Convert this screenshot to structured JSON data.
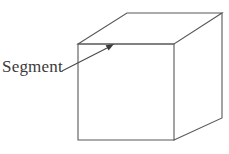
{
  "figure": {
    "background_color": "#ffffff",
    "line_color": "#585858",
    "text_color": "#3a3a3a",
    "label": {
      "text": "Segment",
      "x": 2,
      "y": 57,
      "font_size_px": 17
    },
    "leader_line": {
      "from": [
        62,
        71
      ],
      "to": [
        113,
        45
      ],
      "arrow_at": "to",
      "points_to_vertex": "front-top-left-edge-of-top-face"
    },
    "cube": {
      "type": "wireframe-cube-oblique",
      "visible_faces": [
        "front",
        "top",
        "right"
      ],
      "vertices": {
        "front_top_left": [
          78,
          44
        ],
        "front_top_right": [
          174,
          44
        ],
        "front_bottom_right": [
          174,
          140
        ],
        "front_bottom_left": [
          78,
          140
        ],
        "back_top_left": [
          127,
          13
        ],
        "back_top_right": [
          222,
          13
        ],
        "back_bottom_right": [
          222,
          118
        ]
      },
      "edges": [
        [
          "front_top_left",
          "front_top_right"
        ],
        [
          "front_top_right",
          "front_bottom_right"
        ],
        [
          "front_bottom_right",
          "front_bottom_left"
        ],
        [
          "front_bottom_left",
          "front_top_left"
        ],
        [
          "front_top_left",
          "back_top_left"
        ],
        [
          "back_top_left",
          "back_top_right"
        ],
        [
          "back_top_right",
          "front_top_right"
        ],
        [
          "back_top_right",
          "back_bottom_right"
        ],
        [
          "back_bottom_right",
          "front_bottom_right"
        ]
      ]
    }
  }
}
